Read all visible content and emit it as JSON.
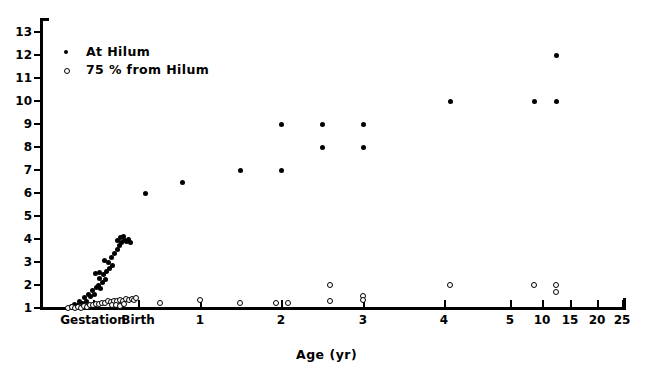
{
  "chart_data": {
    "type": "scatter",
    "title": "",
    "xlabel": "Age (yr)",
    "ylabel": "",
    "grid": false,
    "legend_position": "top-left",
    "ylim": [
      1,
      13
    ],
    "yticks": [
      1,
      2,
      3,
      4,
      5,
      6,
      7,
      8,
      9,
      10,
      11,
      12,
      13
    ],
    "ytick_labels": [
      "1",
      "2",
      "3",
      "4",
      "5",
      "6",
      "7",
      "8",
      "9",
      "10",
      "11",
      "12",
      "13"
    ],
    "x_axis_note": "non-linear: linear through 5 yr then compressed for 10, 15, 20, 25",
    "xticks": [
      {
        "label": "Gestation",
        "px": 93
      },
      {
        "label": "Birth",
        "px": 138
      },
      {
        "label": "1",
        "px": 200
      },
      {
        "label": "2",
        "px": 281
      },
      {
        "label": "3",
        "px": 363
      },
      {
        "label": "4",
        "px": 444
      },
      {
        "label": "5",
        "px": 510
      },
      {
        "label": "10",
        "px": 542
      },
      {
        "label": "15",
        "px": 570
      },
      {
        "label": "20",
        "px": 597
      },
      {
        "label": "25",
        "px": 622
      }
    ],
    "series": [
      {
        "name": "At Hilum",
        "marker": "filled-circle",
        "color": "#000000",
        "points": [
          [
            71,
            1.05
          ],
          [
            74,
            1.15
          ],
          [
            77,
            1.1
          ],
          [
            79,
            1.3
          ],
          [
            82,
            1.2
          ],
          [
            84,
            1.45
          ],
          [
            86,
            1.3
          ],
          [
            88,
            1.6
          ],
          [
            90,
            1.5
          ],
          [
            92,
            1.75
          ],
          [
            94,
            1.6
          ],
          [
            96,
            1.9
          ],
          [
            98,
            2.0
          ],
          [
            100,
            1.85
          ],
          [
            102,
            2.1
          ],
          [
            95,
            2.5
          ],
          [
            99,
            2.55
          ],
          [
            103,
            2.45
          ],
          [
            106,
            2.6
          ],
          [
            109,
            2.7
          ],
          [
            112,
            2.85
          ],
          [
            104,
            3.05
          ],
          [
            108,
            3.0
          ],
          [
            111,
            3.2
          ],
          [
            114,
            3.35
          ],
          [
            117,
            3.55
          ],
          [
            119,
            3.7
          ],
          [
            121,
            3.85
          ],
          [
            124,
            3.95
          ],
          [
            126,
            3.9
          ],
          [
            128,
            4.0
          ],
          [
            123,
            4.1
          ],
          [
            120,
            4.05
          ],
          [
            117,
            3.95
          ],
          [
            130,
            3.85
          ],
          [
            105,
            2.25
          ],
          [
            99,
            2.3
          ],
          [
            145,
            6.0
          ],
          [
            182,
            6.45
          ],
          [
            240,
            7.0
          ],
          [
            281,
            7.0
          ],
          [
            281,
            9.0
          ],
          [
            322,
            9.0
          ],
          [
            363,
            9.0
          ],
          [
            322,
            8.0
          ],
          [
            363,
            8.0
          ],
          [
            450,
            10.0
          ],
          [
            534,
            10.0
          ],
          [
            556,
            10.0
          ],
          [
            556,
            12.0
          ]
        ]
      },
      {
        "name": "75 % from Hilum",
        "marker": "open-circle",
        "color": "#000000",
        "points": [
          [
            68,
            1.0
          ],
          [
            72,
            1.02
          ],
          [
            75,
            1.0
          ],
          [
            78,
            1.05
          ],
          [
            81,
            1.0
          ],
          [
            84,
            1.08
          ],
          [
            87,
            1.05
          ],
          [
            90,
            1.12
          ],
          [
            93,
            1.1
          ],
          [
            96,
            1.18
          ],
          [
            99,
            1.15
          ],
          [
            102,
            1.22
          ],
          [
            105,
            1.2
          ],
          [
            108,
            1.28
          ],
          [
            111,
            1.25
          ],
          [
            114,
            1.3
          ],
          [
            117,
            1.28
          ],
          [
            120,
            1.35
          ],
          [
            123,
            1.3
          ],
          [
            126,
            1.38
          ],
          [
            129,
            1.32
          ],
          [
            132,
            1.4
          ],
          [
            134,
            1.35
          ],
          [
            136,
            1.42
          ],
          [
            112,
            1.1
          ],
          [
            116,
            1.12
          ],
          [
            120,
            1.08
          ],
          [
            124,
            1.15
          ],
          [
            160,
            1.2
          ],
          [
            200,
            1.35
          ],
          [
            240,
            1.2
          ],
          [
            276,
            1.2
          ],
          [
            288,
            1.2
          ],
          [
            330,
            2.0
          ],
          [
            330,
            1.3
          ],
          [
            363,
            1.5
          ],
          [
            363,
            1.35
          ],
          [
            450,
            2.0
          ],
          [
            534,
            2.0
          ],
          [
            556,
            2.0
          ],
          [
            556,
            1.7
          ]
        ]
      }
    ]
  },
  "legend": {
    "items": [
      {
        "label": "At Hilum",
        "marker": "filled-circle"
      },
      {
        "label": "75 %  from Hilum",
        "marker": "open-circle"
      }
    ]
  },
  "axis": {
    "x_title": "Age (yr)"
  }
}
